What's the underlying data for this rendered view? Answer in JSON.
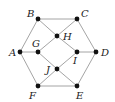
{
  "diagram": {
    "type": "graph",
    "colors": {
      "edge": "#9a9a9a",
      "node": "#111111",
      "label": "#222222",
      "background": "#ffffff"
    },
    "nodes": [
      {
        "id": "A",
        "label": "A",
        "x": 20,
        "y": 52,
        "lx": 9,
        "ly": 56
      },
      {
        "id": "B",
        "label": "B",
        "x": 38,
        "y": 19,
        "lx": 27,
        "ly": 17
      },
      {
        "id": "C",
        "label": "C",
        "x": 77,
        "y": 19,
        "lx": 81,
        "ly": 17
      },
      {
        "id": "D",
        "label": "D",
        "x": 96,
        "y": 52,
        "lx": 101,
        "ly": 56
      },
      {
        "id": "E",
        "label": "E",
        "x": 77,
        "y": 86,
        "lx": 76,
        "ly": 99
      },
      {
        "id": "F",
        "label": "F",
        "x": 38,
        "y": 86,
        "lx": 29,
        "ly": 99
      },
      {
        "id": "G",
        "label": "G",
        "x": 38,
        "y": 52,
        "lx": 32,
        "ly": 47
      },
      {
        "id": "H",
        "label": "H",
        "x": 57,
        "y": 36,
        "lx": 63,
        "ly": 40
      },
      {
        "id": "I",
        "label": "I",
        "x": 77,
        "y": 52,
        "lx": 73,
        "ly": 64
      },
      {
        "id": "J",
        "label": "J",
        "x": 57,
        "y": 69,
        "lx": 46,
        "ly": 73
      }
    ],
    "edges": [
      [
        "A",
        "B"
      ],
      [
        "B",
        "C"
      ],
      [
        "C",
        "D"
      ],
      [
        "D",
        "E"
      ],
      [
        "E",
        "F"
      ],
      [
        "F",
        "A"
      ],
      [
        "A",
        "G"
      ],
      [
        "B",
        "H"
      ],
      [
        "C",
        "H"
      ],
      [
        "G",
        "H"
      ],
      [
        "H",
        "I"
      ],
      [
        "I",
        "D"
      ],
      [
        "G",
        "J"
      ],
      [
        "J",
        "E"
      ],
      [
        "J",
        "I"
      ],
      [
        "J",
        "F"
      ]
    ]
  }
}
